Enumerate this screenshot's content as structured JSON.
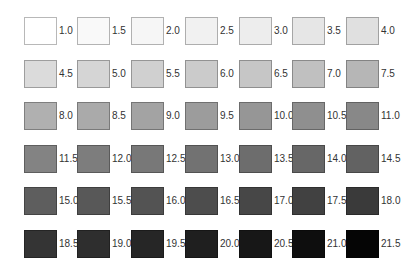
{
  "chart_data": {
    "type": "table",
    "title": "",
    "layout": {
      "columns": 7,
      "rows": 6,
      "grid": false,
      "legend": "none"
    },
    "values": [
      1.0,
      1.5,
      2.0,
      2.5,
      3.0,
      3.5,
      4.0,
      4.5,
      5.0,
      5.5,
      6.0,
      6.5,
      7.0,
      7.5,
      8.0,
      8.5,
      9.0,
      9.5,
      10.0,
      10.5,
      11.0,
      11.5,
      12.0,
      12.5,
      13.0,
      13.5,
      14.0,
      14.5,
      15.0,
      15.5,
      16.0,
      16.5,
      17.0,
      17.5,
      18.0,
      18.5,
      19.0,
      19.5,
      20.0,
      20.5,
      21.0,
      21.5
    ],
    "labels": [
      "1.0",
      "1.5",
      "2.0",
      "2.5",
      "3.0",
      "3.5",
      "4.0",
      "4.5",
      "5.0",
      "5.5",
      "6.0",
      "6.5",
      "7.0",
      "7.5",
      "8.0",
      "8.5",
      "9.0",
      "9.5",
      "10.0",
      "10.5",
      "11.0",
      "11.5",
      "12.0",
      "12.5",
      "13.0",
      "13.5",
      "14.0",
      "14.5",
      "15.0",
      "15.5",
      "16.0",
      "16.5",
      "17.0",
      "17.5",
      "18.0",
      "18.5",
      "19.0",
      "19.5",
      "20.0",
      "20.5",
      "21.0",
      "21.5"
    ],
    "colors": [
      "#ffffff",
      "#f9f9f9",
      "#f6f6f6",
      "#f1f1f1",
      "#ededed",
      "#e6e6e6",
      "#e0e0e0",
      "#dbdbdb",
      "#d5d5d5",
      "#d0d0d0",
      "#cbcbcb",
      "#c6c6c6",
      "#c0c0c0",
      "#b6b6b6",
      "#b0b0b0",
      "#aaaaaa",
      "#a3a3a3",
      "#9c9c9c",
      "#969696",
      "#8f8f8f",
      "#888888",
      "#838383",
      "#7d7d7d",
      "#787878",
      "#727272",
      "#6d6d6d",
      "#676767",
      "#626262",
      "#5e5e5e",
      "#585858",
      "#535353",
      "#4d4d4d",
      "#474747",
      "#414141",
      "#3a3a3a",
      "#343434",
      "#2e2e2e",
      "#262626",
      "#1f1f1f",
      "#171717",
      "#0e0e0e",
      "#050505"
    ]
  }
}
